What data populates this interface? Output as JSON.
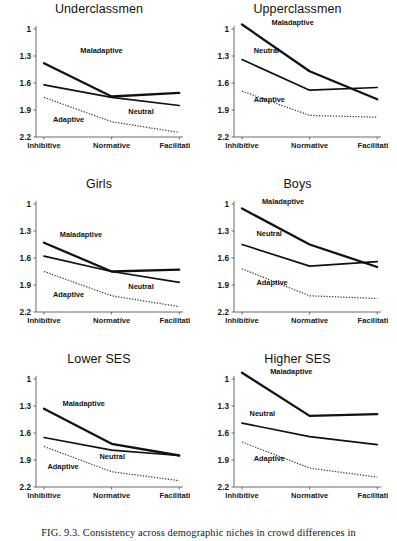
{
  "figure": {
    "caption": "FIG. 9.3.  Consistency across demographic niches in crowd differences in",
    "caption_number": "FIG. 9.3."
  },
  "axes": {
    "y_ticks": [
      "2.2",
      "1.9",
      "1.6",
      "1.3",
      "1"
    ],
    "x_ticks": [
      "Inhibitive",
      "Normative",
      "Facilitative"
    ],
    "series_labels": {
      "maladaptive": "Maladaptive",
      "neutral": "Neutral",
      "adaptive": "Adaptive"
    }
  },
  "chart_data": [
    {
      "type": "line",
      "title": "Underclassmen",
      "xlabel": "",
      "ylabel": "",
      "categories": [
        "Inhibitive",
        "Normative",
        "Facilitative"
      ],
      "ylim": [
        1,
        2.2
      ],
      "yticks": [
        1,
        1.3,
        1.6,
        1.9,
        2.2
      ],
      "grid": false,
      "legend": "inline-annotations",
      "series": [
        {
          "name": "Maladaptive",
          "style": "solid-thick",
          "values": [
            1.82,
            1.45,
            1.49
          ],
          "label_x": "Normative",
          "label_pos": [
            0.28,
            1.93
          ]
        },
        {
          "name": "Neutral",
          "style": "solid-medium",
          "values": [
            1.58,
            1.44,
            1.35
          ],
          "label_pos": [
            0.63,
            1.26
          ]
        },
        {
          "name": "Adaptive",
          "style": "dotted",
          "values": [
            1.44,
            1.17,
            1.05
          ],
          "label_pos": [
            0.08,
            1.17
          ]
        }
      ]
    },
    {
      "type": "line",
      "title": "Upperclassmen",
      "xlabel": "",
      "ylabel": "",
      "categories": [
        "Inhibitive",
        "Normative",
        "Facilitative"
      ],
      "ylim": [
        1,
        2.2
      ],
      "yticks": [
        1,
        1.3,
        1.6,
        1.9,
        2.2
      ],
      "grid": false,
      "legend": "inline-annotations",
      "series": [
        {
          "name": "Maladaptive",
          "style": "solid-thick",
          "values": [
            2.25,
            1.73,
            1.42
          ],
          "label_pos": [
            0.23,
            2.24
          ]
        },
        {
          "name": "Neutral",
          "style": "solid-medium",
          "values": [
            1.86,
            1.52,
            1.55
          ],
          "label_pos": [
            0.1,
            1.93
          ]
        },
        {
          "name": "Adaptive",
          "style": "dotted",
          "values": [
            1.51,
            1.24,
            1.22
          ],
          "label_pos": [
            0.1,
            1.39
          ]
        }
      ]
    },
    {
      "type": "line",
      "title": "Girls",
      "xlabel": "",
      "ylabel": "",
      "categories": [
        "Inhibitive",
        "Normative",
        "Facilitative"
      ],
      "ylim": [
        1,
        2.2
      ],
      "yticks": [
        1,
        1.3,
        1.6,
        1.9,
        2.2
      ],
      "grid": false,
      "legend": "inline-annotations",
      "series": [
        {
          "name": "Maladaptive",
          "style": "solid-thick",
          "values": [
            1.77,
            1.45,
            1.47
          ],
          "label_pos": [
            0.13,
            1.83
          ]
        },
        {
          "name": "Neutral",
          "style": "solid-medium",
          "values": [
            1.62,
            1.45,
            1.33
          ],
          "label_pos": [
            0.63,
            1.26
          ]
        },
        {
          "name": "Adaptive",
          "style": "dotted",
          "values": [
            1.45,
            1.18,
            1.06
          ],
          "label_pos": [
            0.08,
            1.17
          ]
        }
      ]
    },
    {
      "type": "line",
      "title": "Boys",
      "xlabel": "",
      "ylabel": "",
      "categories": [
        "Inhibitive",
        "Normative",
        "Facilitative"
      ],
      "ylim": [
        1,
        2.2
      ],
      "yticks": [
        1,
        1.3,
        1.6,
        1.9,
        2.2
      ],
      "grid": false,
      "legend": "inline-annotations",
      "series": [
        {
          "name": "Maladaptive",
          "style": "solid-thick",
          "values": [
            2.15,
            1.75,
            1.5
          ],
          "label_pos": [
            0.16,
            2.2
          ]
        },
        {
          "name": "Neutral",
          "style": "solid-medium",
          "values": [
            1.75,
            1.51,
            1.56
          ],
          "label_pos": [
            0.12,
            1.85
          ]
        },
        {
          "name": "Adaptive",
          "style": "dotted",
          "values": [
            1.48,
            1.18,
            1.15
          ],
          "label_pos": [
            0.12,
            1.3
          ]
        }
      ]
    },
    {
      "type": "line",
      "title": "Lower SES",
      "xlabel": "",
      "ylabel": "",
      "categories": [
        "Inhibitive",
        "Normative",
        "Facilitative"
      ],
      "ylim": [
        1,
        2.2
      ],
      "yticks": [
        1,
        1.3,
        1.6,
        1.9,
        2.2
      ],
      "grid": false,
      "legend": "inline-annotations",
      "series": [
        {
          "name": "Maladaptive",
          "style": "solid-thick",
          "values": [
            1.87,
            1.48,
            1.35
          ],
          "label_pos": [
            0.15,
            1.9
          ]
        },
        {
          "name": "Neutral",
          "style": "solid-medium",
          "values": [
            1.55,
            1.41,
            1.35
          ],
          "label_pos": [
            0.42,
            1.31
          ]
        },
        {
          "name": "Adaptive",
          "style": "dotted",
          "values": [
            1.45,
            1.17,
            1.07
          ],
          "label_pos": [
            0.04,
            1.2
          ]
        }
      ]
    },
    {
      "type": "line",
      "title": "Higher SES",
      "xlabel": "",
      "ylabel": "",
      "categories": [
        "Inhibitive",
        "Normative",
        "Facilitative"
      ],
      "ylim": [
        1,
        2.2
      ],
      "yticks": [
        1,
        1.3,
        1.6,
        1.9,
        2.2
      ],
      "grid": false,
      "legend": "inline-annotations",
      "series": [
        {
          "name": "Maladaptive",
          "style": "solid-thick",
          "values": [
            2.27,
            1.79,
            1.81
          ],
          "label_pos": [
            0.22,
            2.26
          ]
        },
        {
          "name": "Neutral",
          "style": "solid-medium",
          "values": [
            1.71,
            1.56,
            1.47
          ],
          "label_pos": [
            0.07,
            1.79
          ]
        },
        {
          "name": "Adaptive",
          "style": "dotted",
          "values": [
            1.5,
            1.21,
            1.11
          ],
          "label_pos": [
            0.1,
            1.29
          ]
        }
      ]
    }
  ]
}
